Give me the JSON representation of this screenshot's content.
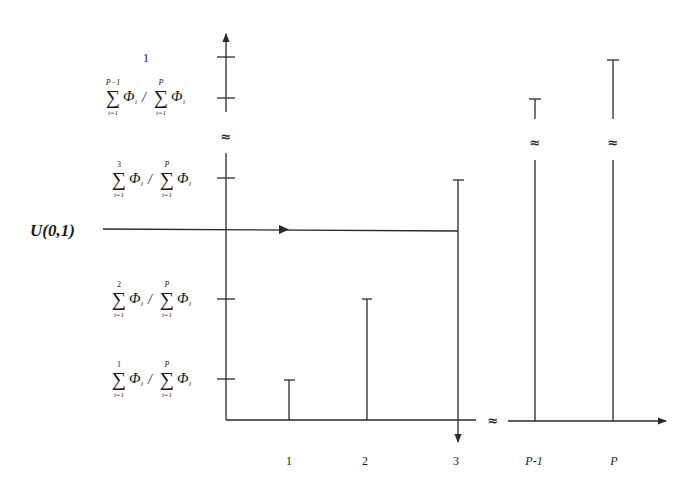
{
  "diagram": {
    "input_label": "U(0,1)",
    "break_symbol": "≈",
    "y_axis": {
      "top_label": "1",
      "ticks": [
        {
          "id": "pm1",
          "upper": "P−1",
          "lower": "i=1",
          "num": "Φ",
          "num_sub": "i",
          "den_upper": "P",
          "den_lower": "i=1",
          "den": "Φ",
          "den_sub": "i"
        },
        {
          "id": "s3",
          "upper": "3",
          "lower": "i=1",
          "num": "Φ",
          "num_sub": "i",
          "den_upper": "P",
          "den_lower": "i=1",
          "den": "Φ",
          "den_sub": "i"
        },
        {
          "id": "s2",
          "upper": "2",
          "lower": "i=1",
          "num": "Φ",
          "num_sub": "i",
          "den_upper": "P",
          "den_lower": "i=1",
          "den": "Φ",
          "den_sub": "i"
        },
        {
          "id": "s1",
          "upper": "1",
          "lower": "i=1",
          "num": "Φ",
          "num_sub": "i",
          "den_upper": "P",
          "den_lower": "i=1",
          "den": "Φ",
          "den_sub": "i"
        }
      ],
      "sum_symbol": "∑",
      "slash": "/"
    },
    "x_axis": {
      "labels": [
        "1",
        "2",
        "3",
        "P-1",
        "P"
      ]
    },
    "bars": [
      {
        "label": "1",
        "top": "∑1 Φi / ∑P Φi"
      },
      {
        "label": "2",
        "top": "∑2 Φi / ∑P Φi"
      },
      {
        "label": "3",
        "top": "∑3 Φi / ∑P Φi",
        "selected": true
      },
      {
        "label": "P-1",
        "top": "∑P−1 Φi / ∑P Φi"
      },
      {
        "label": "P",
        "top": "1"
      }
    ]
  }
}
